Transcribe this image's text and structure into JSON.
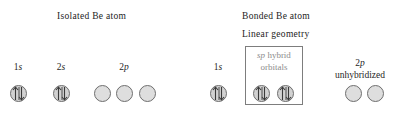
{
  "figure": {
    "kind": "orbital-energy-diagram",
    "element": "Be",
    "headings": {
      "isolated": "Isolated Be atom",
      "bonded": "Bonded Be atom",
      "geometry": "Linear geometry"
    },
    "colors": {
      "text": "#232323",
      "hybrid_caption": "#8c8c8c",
      "orbital_fill": "#dcdcdc",
      "orbital_stroke": "#6e6e6e",
      "box_stroke": "#7d7d7d",
      "background": "#ffffff"
    }
  },
  "isolated_atom": {
    "groups": [
      {
        "id": "1s",
        "label_prefix": "1",
        "label_italic": "s",
        "label_suffix": "",
        "label_text": "1s",
        "center_x": 18,
        "label_y": 62,
        "orbitals": [
          {
            "x": 10,
            "y": 85,
            "state": "filled",
            "electrons": 2,
            "spins": "up-down"
          }
        ]
      },
      {
        "id": "2s",
        "label_prefix": "2",
        "label_italic": "s",
        "label_suffix": "",
        "label_text": "2s",
        "center_x": 61,
        "label_y": 62,
        "orbitals": [
          {
            "x": 53,
            "y": 85,
            "state": "filled",
            "electrons": 2,
            "spins": "up-down"
          }
        ]
      },
      {
        "id": "2p",
        "label_prefix": "2",
        "label_italic": "p",
        "label_suffix": "",
        "label_text": "2p",
        "center_x": 124,
        "label_y": 62,
        "orbitals": [
          {
            "x": 94,
            "y": 85,
            "state": "empty",
            "electrons": 0,
            "spins": ""
          },
          {
            "x": 116,
            "y": 85,
            "state": "empty",
            "electrons": 0,
            "spins": ""
          },
          {
            "x": 139,
            "y": 85,
            "state": "empty",
            "electrons": 0,
            "spins": ""
          }
        ]
      }
    ]
  },
  "bonded_atom": {
    "groups": [
      {
        "id": "1s-bonded",
        "label_prefix": "1",
        "label_italic": "s",
        "label_suffix": "",
        "label_text": "1s",
        "center_x": 218,
        "label_y": 62,
        "orbitals": [
          {
            "x": 210,
            "y": 85,
            "state": "filled",
            "electrons": 2,
            "spins": "up-down"
          }
        ]
      },
      {
        "id": "2p-unhybridized",
        "label_prefix": "2",
        "label_italic": "p",
        "label_suffix": "",
        "label_text": "2p",
        "center_x": 360,
        "label_y": 58,
        "second_line": "unhybridized",
        "second_line_y": 70,
        "orbitals": [
          {
            "x": 345,
            "y": 85,
            "state": "empty",
            "electrons": 0,
            "spins": ""
          },
          {
            "x": 367,
            "y": 85,
            "state": "empty",
            "electrons": 0,
            "spins": ""
          }
        ]
      }
    ],
    "hybrid_box": {
      "caption_line_1_italic": "sp",
      "caption_line_1_rest": " hybrid",
      "caption_line_2": "orbitals",
      "orbitals": [
        {
          "x": 253,
          "y": 85,
          "state": "filled",
          "electrons": 2,
          "spins": "up-down"
        },
        {
          "x": 277,
          "y": 85,
          "state": "filled",
          "electrons": 2,
          "spins": "up-down"
        }
      ]
    }
  }
}
